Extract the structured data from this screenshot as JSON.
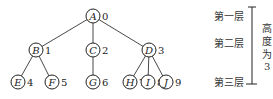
{
  "tree": {
    "nodes": [
      {
        "id": "A",
        "index": "0",
        "x": 93,
        "y": 16
      },
      {
        "id": "B",
        "index": "1",
        "x": 36,
        "y": 50
      },
      {
        "id": "C",
        "index": "2",
        "x": 93,
        "y": 50
      },
      {
        "id": "D",
        "index": "3",
        "x": 149,
        "y": 50
      },
      {
        "id": "E",
        "index": "4",
        "x": 18,
        "y": 82
      },
      {
        "id": "F",
        "index": "5",
        "x": 52,
        "y": 82
      },
      {
        "id": "G",
        "index": "6",
        "x": 93,
        "y": 82
      },
      {
        "id": "H",
        "index": "7",
        "x": 130,
        "y": 82
      },
      {
        "id": "I",
        "index": "8",
        "x": 148,
        "y": 82
      },
      {
        "id": "J",
        "index": "9",
        "x": 166,
        "y": 82
      }
    ],
    "edges": [
      [
        "A",
        "B"
      ],
      [
        "A",
        "C"
      ],
      [
        "A",
        "D"
      ],
      [
        "B",
        "E"
      ],
      [
        "B",
        "F"
      ],
      [
        "C",
        "G"
      ],
      [
        "D",
        "H"
      ],
      [
        "D",
        "I"
      ],
      [
        "D",
        "J"
      ]
    ]
  },
  "levels": {
    "level1": "第一层",
    "level2": "第二层",
    "level3": "第三层"
  },
  "height_label": {
    "chars": [
      "高",
      "度",
      "为",
      "3"
    ]
  }
}
